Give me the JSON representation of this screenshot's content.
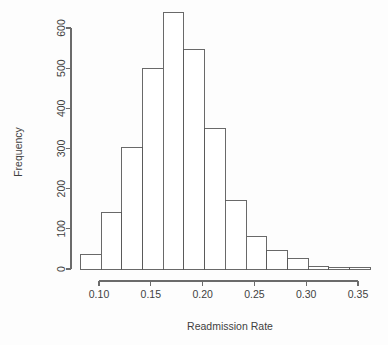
{
  "chart_data": {
    "type": "bar",
    "subtype": "histogram",
    "title": "",
    "xlabel": "Readmission Rate",
    "ylabel": "Frequency",
    "xlim": [
      0.08,
      0.36
    ],
    "ylim": [
      0,
      650
    ],
    "grid": false,
    "legend": null,
    "bin_width": 0.02,
    "x_ticks": [
      0.1,
      0.15,
      0.2,
      0.25,
      0.3,
      0.35
    ],
    "x_tick_labels": [
      "0.10",
      "0.15",
      "0.20",
      "0.25",
      "0.30",
      "0.35"
    ],
    "y_ticks": [
      0,
      100,
      200,
      300,
      400,
      500,
      600
    ],
    "y_tick_labels": [
      "0",
      "100",
      "200",
      "300",
      "400",
      "500",
      "600"
    ],
    "bins": [
      {
        "left": 0.082,
        "right": 0.102,
        "value": 35
      },
      {
        "left": 0.102,
        "right": 0.122,
        "value": 140
      },
      {
        "left": 0.122,
        "right": 0.142,
        "value": 303
      },
      {
        "left": 0.142,
        "right": 0.162,
        "value": 498
      },
      {
        "left": 0.162,
        "right": 0.182,
        "value": 638
      },
      {
        "left": 0.182,
        "right": 0.202,
        "value": 546
      },
      {
        "left": 0.202,
        "right": 0.222,
        "value": 350
      },
      {
        "left": 0.222,
        "right": 0.242,
        "value": 170
      },
      {
        "left": 0.242,
        "right": 0.262,
        "value": 82
      },
      {
        "left": 0.262,
        "right": 0.282,
        "value": 45
      },
      {
        "left": 0.282,
        "right": 0.302,
        "value": 27
      },
      {
        "left": 0.302,
        "right": 0.322,
        "value": 5
      },
      {
        "left": 0.322,
        "right": 0.342,
        "value": 3
      },
      {
        "left": 0.342,
        "right": 0.362,
        "value": 3
      }
    ],
    "categories": [
      "0.082-0.102",
      "0.102-0.122",
      "0.122-0.142",
      "0.142-0.162",
      "0.162-0.182",
      "0.182-0.202",
      "0.202-0.222",
      "0.222-0.242",
      "0.242-0.262",
      "0.262-0.282",
      "0.282-0.302",
      "0.302-0.322",
      "0.322-0.342",
      "0.342-0.362"
    ],
    "values": [
      35,
      140,
      303,
      498,
      638,
      546,
      350,
      170,
      82,
      45,
      27,
      5,
      3,
      3
    ]
  },
  "colors": {
    "bar_fill": "#ffffff",
    "bar_stroke": "#595959",
    "axis": "#6b6b6b",
    "text": "#3f3f3f",
    "background": "#fdfdfd"
  }
}
